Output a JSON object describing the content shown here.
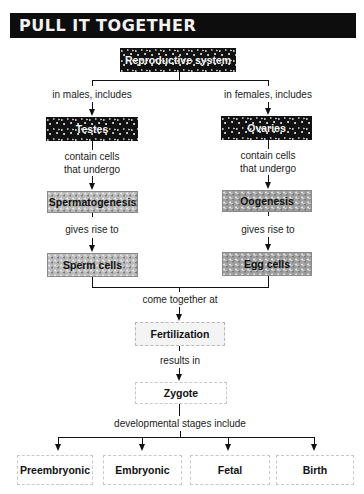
{
  "title": "PULL IT TOGETHER",
  "root": {
    "label": "Reproductive system"
  },
  "left_branch": {
    "connector": "in males, includes",
    "organ": "Testes",
    "connector2": "contain cells\nthat undergo",
    "process": "Spermatogenesis",
    "connector3": "gives rise to",
    "gamete": "Sperm cells"
  },
  "right_branch": {
    "connector": "in females, includes",
    "organ": "Ovaries",
    "connector2": "contain cells\nthat undergo",
    "process": "Oogenesis",
    "connector3": "gives rise to",
    "gamete": "Egg cells"
  },
  "join_label": "come together at",
  "fertilization": "Fertilization",
  "result_label": "results in",
  "zygote": "Zygote",
  "stages_label": "developmental stages include",
  "stages": [
    {
      "label": "Preembryonic"
    },
    {
      "label": "Embryonic"
    },
    {
      "label": "Fetal"
    },
    {
      "label": "Birth"
    }
  ]
}
